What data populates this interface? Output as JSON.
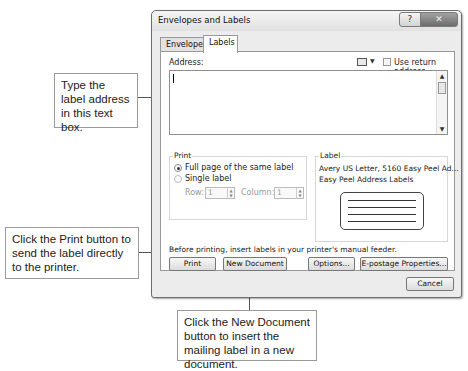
{
  "dialog": {
    "title": "Envelopes and Labels",
    "help_icon": "question-mark",
    "close_icon": "x",
    "tabs": [
      {
        "label": "Envelopes",
        "accesskey": "E",
        "active": false
      },
      {
        "label": "Labels",
        "accesskey": "L",
        "active": true
      }
    ],
    "address": {
      "label": "Address:",
      "value": "",
      "address_book_icon": "address-book",
      "use_return_address_label": "Use return address",
      "use_return_address_checked": false
    },
    "print_group": {
      "label": "Print",
      "options": [
        {
          "label": "Full page of the same label",
          "selected": true
        },
        {
          "label": "Single label",
          "selected": false
        }
      ],
      "row_label": "Row:",
      "row_value": "1",
      "column_label": "Column:",
      "column_value": "1"
    },
    "label_group": {
      "label": "Label",
      "line1": "Avery US Letter, 5160 Easy Peel Ad...",
      "line2": "Easy Peel Address Labels"
    },
    "note": "Before printing, insert labels in your printer's manual feeder.",
    "buttons": {
      "print": "Print",
      "new_document": "New Document",
      "options": "Options...",
      "epostage": "E-postage Properties...",
      "cancel": "Cancel"
    }
  },
  "callouts": {
    "address": "Type the label address in this text box.",
    "print": "Click the Print button to send the label directly to the printer.",
    "new_document": "Click the New Document button to insert the mailing label in a new document."
  }
}
